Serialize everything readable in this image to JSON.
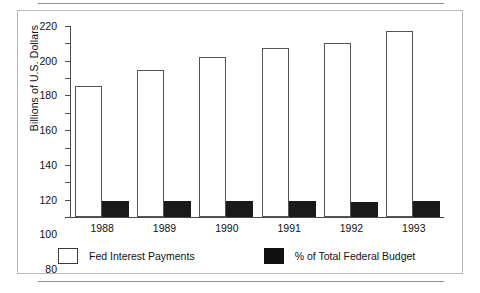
{
  "chart_data": {
    "type": "bar",
    "title": "",
    "xlabel": "",
    "ylabel": "Billions of U.S. Dollars",
    "categories": [
      "1988",
      "1989",
      "1990",
      "1991",
      "1992",
      "1993"
    ],
    "ylim": [
      0,
      220
    ],
    "yticks": [
      0,
      20,
      40,
      60,
      80,
      100,
      120,
      140,
      160,
      180,
      200,
      220
    ],
    "grid": false,
    "legend_position": "bottom",
    "series": [
      {
        "name": "Fed Interest Payments",
        "style": "open",
        "color": "#ffffff",
        "edge_color": "#555555",
        "values": [
          151,
          169,
          184,
          195,
          201,
          214
        ]
      },
      {
        "name": "% of Total Federal Budget",
        "style": "solid",
        "color": "#1a1a1a",
        "edge_color": "#1a1a1a",
        "values": [
          18,
          19,
          19,
          19,
          17,
          19
        ]
      }
    ]
  },
  "legend": {
    "items": [
      {
        "label": "Fed Interest Payments"
      },
      {
        "label": "% of Total Federal Budget"
      }
    ]
  }
}
